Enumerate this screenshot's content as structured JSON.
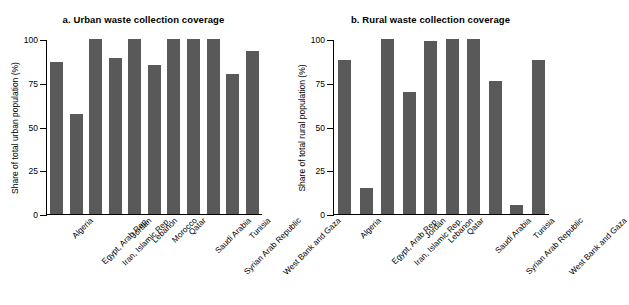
{
  "chart_data": [
    {
      "type": "bar",
      "title": "a. Urban waste collection coverage",
      "xlabel": "",
      "ylabel": "Share of total urban population (%)",
      "ylim": [
        0,
        100
      ],
      "yticks": [
        0,
        25,
        50,
        75,
        100
      ],
      "grid": false,
      "legend": "none",
      "bar_color": "#595959",
      "categories": [
        "Algeria",
        "Egypt, Arab Rep.",
        "Iran, Islamic Rep.",
        "Jordan",
        "Lebanon",
        "Morocco",
        "Qatar",
        "Saudi Arabia",
        "Syrian Arab Republic",
        "Tunisia",
        "West Bank and Gaza"
      ],
      "values": [
        87,
        57,
        100,
        89,
        100,
        85,
        100,
        100,
        100,
        80,
        93
      ]
    },
    {
      "type": "bar",
      "title": "b. Rural waste collection coverage",
      "xlabel": "",
      "ylabel": "Share of total rural population (%)",
      "ylim": [
        0,
        100
      ],
      "yticks": [
        0,
        25,
        50,
        75,
        100
      ],
      "grid": false,
      "legend": "none",
      "bar_color": "#595959",
      "categories": [
        "Algeria",
        "Egypt, Arab Rep.",
        "Iran, Islamic Rep.",
        "Jordan",
        "Lebanon",
        "Qatar",
        "Saudi Arabia",
        "Syrian Arab Republic",
        "Tunisia",
        "West Bank and Gaza"
      ],
      "values": [
        88,
        15,
        100,
        70,
        99,
        100,
        100,
        76,
        5,
        88
      ]
    }
  ]
}
